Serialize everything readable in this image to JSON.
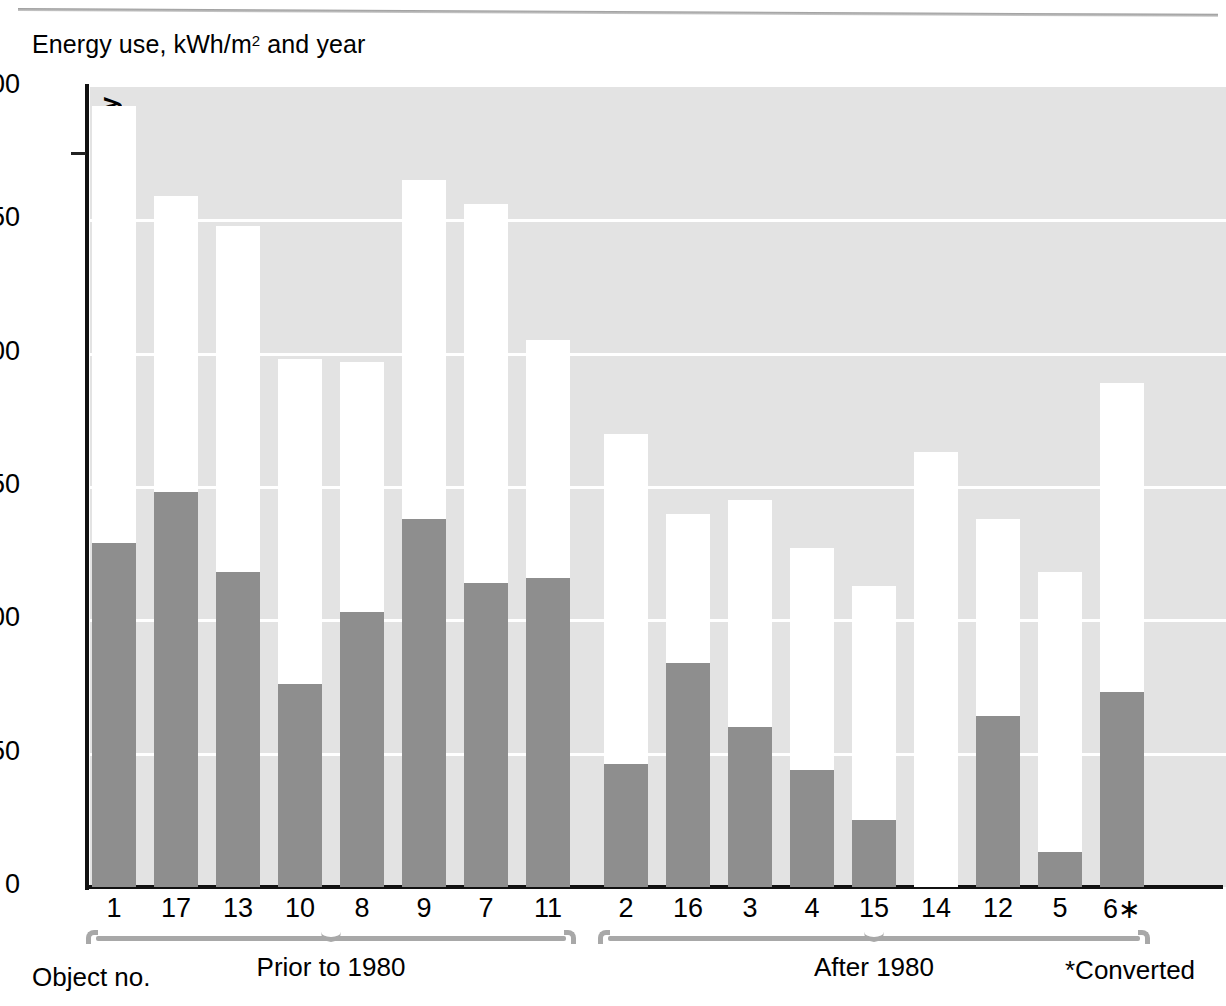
{
  "chart_data": {
    "type": "bar",
    "subtype": "stacked",
    "title": "Energy use, kWh/m2 and year",
    "title_plain": "Energy use, kWh/m",
    "title_sup": "2",
    "title_tail": " and year",
    "xlabel": "Object no.",
    "ylabel": "",
    "ylim": [
      0,
      300
    ],
    "yticks": [
      0,
      50,
      100,
      150,
      200,
      250,
      300
    ],
    "ytick_labels": [
      "0",
      "50",
      "100",
      "150",
      "200",
      "250",
      "300"
    ],
    "grid": true,
    "categories": [
      "1",
      "17",
      "13",
      "10",
      "8",
      "9",
      "7",
      "11",
      "2",
      "16",
      "3",
      "4",
      "15",
      "14",
      "12",
      "5",
      "6*"
    ],
    "series": [
      {
        "name": "District heating",
        "color": "#8e8e8e",
        "values": [
          129,
          148,
          118,
          76,
          103,
          138,
          114,
          116,
          46,
          84,
          60,
          44,
          25,
          0,
          64,
          13,
          73
        ]
      },
      {
        "name": "Electricity",
        "color": "#ffffff",
        "values": [
          164,
          111,
          130,
          122,
          94,
          127,
          142,
          89,
          124,
          56,
          85,
          83,
          88,
          163,
          74,
          105,
          116
        ]
      }
    ],
    "totals": [
      293,
      259,
      248,
      198,
      197,
      265,
      256,
      205,
      170,
      140,
      145,
      127,
      113,
      163,
      138,
      118,
      189
    ],
    "groups": [
      {
        "label": "Prior to 1980",
        "categories": [
          "1",
          "17",
          "13",
          "10",
          "8",
          "9",
          "7",
          "11"
        ]
      },
      {
        "label": "After 1980",
        "categories": [
          "2",
          "16",
          "3",
          "4",
          "15",
          "14",
          "12",
          "5",
          "6*"
        ]
      }
    ],
    "annotations": [
      {
        "text": "*Converted"
      }
    ],
    "series_labels": {
      "electricity": "Electricity",
      "district_heating": "District heating"
    },
    "plot_background": "#e3e3e3",
    "gridline_color": "#ffffff",
    "axis_color": "#111111",
    "bracket_color": "#a8a8a8"
  },
  "labels": {
    "object_no": "Object no.",
    "converted": "*Converted",
    "group1": "Prior to 1980",
    "group2": "After 1980",
    "electricity": "Electricity",
    "district_heating": "District heating",
    "title_main": "Energy use, kWh/m",
    "title_sup": "2",
    "title_rest": " and year"
  },
  "yticks": [
    {
      "value": 300,
      "label": "300"
    },
    {
      "value": 250,
      "label": "250"
    },
    {
      "value": 200,
      "label": "200"
    },
    {
      "value": 150,
      "label": "150"
    },
    {
      "value": 100,
      "label": "100"
    },
    {
      "value": 50,
      "label": "50"
    },
    {
      "value": 0,
      "label": "0"
    }
  ]
}
